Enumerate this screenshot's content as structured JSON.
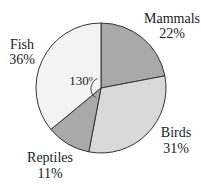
{
  "chart_data": {
    "type": "pie",
    "title": "",
    "start_angle": "12 o'clock",
    "direction": "clockwise",
    "slices": [
      {
        "label": "Mammals",
        "value": 22,
        "display": "22%",
        "color": "#a9a9a9"
      },
      {
        "label": "Birds",
        "value": 31,
        "display": "31%",
        "color": "#d9d9d9"
      },
      {
        "label": "Reptiles",
        "value": 11,
        "display": "11%",
        "color": "#a9a9a9"
      },
      {
        "label": "Fish",
        "value": 36,
        "display": "36%",
        "color": "#f3f3f3"
      }
    ],
    "annotations": [
      {
        "text": "130º",
        "target": "Fish",
        "type": "angle-arc"
      }
    ],
    "legend": "none (labels placed outside slices)"
  },
  "labels": {
    "mammals": {
      "name": "Mammals",
      "pct": "22%"
    },
    "birds": {
      "name": "Birds",
      "pct": "31%"
    },
    "reptiles": {
      "name": "Reptiles",
      "pct": "11%"
    },
    "fish": {
      "name": "Fish",
      "pct": "36%"
    },
    "angle": "130º"
  },
  "colors": {
    "outline": "#333333",
    "dark_slice": "#a9a9a9",
    "light_slice": "#d9d9d9",
    "lightest_slice": "#f3f3f3"
  }
}
